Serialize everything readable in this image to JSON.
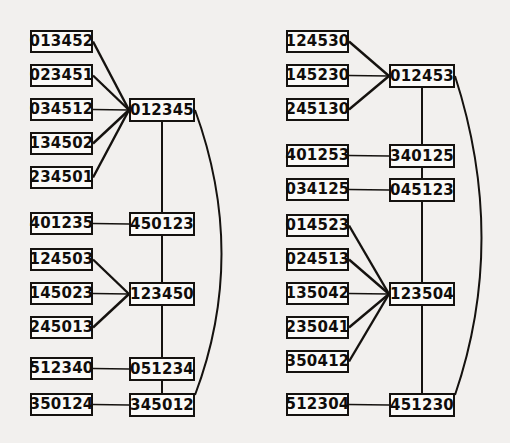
{
  "figure": {
    "background_color": "#f2f0ee",
    "node_fill": "#fbfaf8",
    "node_stroke": "#15120f",
    "edge_color": "#15120f"
  },
  "diagrams": [
    {
      "name": "left-diagram",
      "left_column": [
        {
          "id": "L0",
          "label": "013452",
          "x": 30,
          "y": 30,
          "w": 63,
          "h": 23
        },
        {
          "id": "L1",
          "label": "023451",
          "x": 30,
          "y": 64,
          "w": 63,
          "h": 23
        },
        {
          "id": "L2",
          "label": "034512",
          "x": 30,
          "y": 98,
          "w": 63,
          "h": 23
        },
        {
          "id": "L3",
          "label": "134502",
          "x": 30,
          "y": 132,
          "w": 63,
          "h": 23
        },
        {
          "id": "L4",
          "label": "234501",
          "x": 30,
          "y": 166,
          "w": 63,
          "h": 23
        },
        {
          "id": "L5",
          "label": "401235",
          "x": 30,
          "y": 212,
          "w": 63,
          "h": 23
        },
        {
          "id": "L6",
          "label": "124503",
          "x": 30,
          "y": 248,
          "w": 63,
          "h": 23
        },
        {
          "id": "L7",
          "label": "145023",
          "x": 30,
          "y": 282,
          "w": 63,
          "h": 23
        },
        {
          "id": "L8",
          "label": "245013",
          "x": 30,
          "y": 316,
          "w": 63,
          "h": 23
        },
        {
          "id": "L9",
          "label": "512340",
          "x": 30,
          "y": 357,
          "w": 63,
          "h": 23
        },
        {
          "id": "L10",
          "label": "350124",
          "x": 30,
          "y": 393,
          "w": 63,
          "h": 23
        }
      ],
      "right_column": [
        {
          "id": "R0",
          "label": "012345",
          "x": 129,
          "y": 98,
          "w": 66,
          "h": 24
        },
        {
          "id": "R1",
          "label": "450123",
          "x": 129,
          "y": 212,
          "w": 66,
          "h": 24
        },
        {
          "id": "R2",
          "label": "123450",
          "x": 129,
          "y": 282,
          "w": 66,
          "h": 24
        },
        {
          "id": "R3",
          "label": "051234",
          "x": 129,
          "y": 357,
          "w": 66,
          "h": 24
        },
        {
          "id": "R4",
          "label": "345012",
          "x": 129,
          "y": 393,
          "w": 66,
          "h": 24
        }
      ],
      "fan_edges": [
        {
          "from": "L0",
          "to": "R0"
        },
        {
          "from": "L1",
          "to": "R0"
        },
        {
          "from": "L2",
          "to": "R0"
        },
        {
          "from": "L3",
          "to": "R0"
        },
        {
          "from": "L4",
          "to": "R0"
        },
        {
          "from": "L5",
          "to": "R1"
        },
        {
          "from": "L6",
          "to": "R2"
        },
        {
          "from": "L7",
          "to": "R2"
        },
        {
          "from": "L8",
          "to": "R2"
        },
        {
          "from": "L9",
          "to": "R3"
        },
        {
          "from": "L10",
          "to": "R4"
        }
      ],
      "spine": {
        "x": 162,
        "y1": 122,
        "y2": 393
      },
      "arc": {
        "x1": 195,
        "y1": 110,
        "cx": 248,
        "cy": 255,
        "x2": 195,
        "y2": 395
      }
    },
    {
      "name": "right-diagram",
      "left_column": [
        {
          "id": "RL0",
          "label": "124530",
          "x": 286,
          "y": 30,
          "w": 63,
          "h": 23
        },
        {
          "id": "RL1",
          "label": "145230",
          "x": 286,
          "y": 64,
          "w": 63,
          "h": 23
        },
        {
          "id": "RL2",
          "label": "245130",
          "x": 286,
          "y": 98,
          "w": 63,
          "h": 23
        },
        {
          "id": "RL3",
          "label": "401253",
          "x": 286,
          "y": 144,
          "w": 63,
          "h": 23
        },
        {
          "id": "RL4",
          "label": "034125",
          "x": 286,
          "y": 178,
          "w": 63,
          "h": 23
        },
        {
          "id": "RL5",
          "label": "014523",
          "x": 286,
          "y": 214,
          "w": 63,
          "h": 23
        },
        {
          "id": "RL6",
          "label": "024513",
          "x": 286,
          "y": 248,
          "w": 63,
          "h": 23
        },
        {
          "id": "RL7",
          "label": "135042",
          "x": 286,
          "y": 282,
          "w": 63,
          "h": 23
        },
        {
          "id": "RL8",
          "label": "235041",
          "x": 286,
          "y": 316,
          "w": 63,
          "h": 23
        },
        {
          "id": "RL9",
          "label": "350412",
          "x": 286,
          "y": 350,
          "w": 63,
          "h": 23
        },
        {
          "id": "RL10",
          "label": "512304",
          "x": 286,
          "y": 393,
          "w": 63,
          "h": 23
        }
      ],
      "right_column": [
        {
          "id": "RR0",
          "label": "012453",
          "x": 389,
          "y": 64,
          "w": 66,
          "h": 24
        },
        {
          "id": "RR1",
          "label": "340125",
          "x": 389,
          "y": 144,
          "w": 66,
          "h": 24
        },
        {
          "id": "RR2",
          "label": "045123",
          "x": 389,
          "y": 178,
          "w": 66,
          "h": 24
        },
        {
          "id": "RR3",
          "label": "123504",
          "x": 389,
          "y": 282,
          "w": 66,
          "h": 24
        },
        {
          "id": "RR4",
          "label": "451230",
          "x": 389,
          "y": 393,
          "w": 66,
          "h": 24
        }
      ],
      "fan_edges": [
        {
          "from": "RL0",
          "to": "RR0"
        },
        {
          "from": "RL1",
          "to": "RR0"
        },
        {
          "from": "RL2",
          "to": "RR0"
        },
        {
          "from": "RL3",
          "to": "RR1"
        },
        {
          "from": "RL4",
          "to": "RR2"
        },
        {
          "from": "RL5",
          "to": "RR3"
        },
        {
          "from": "RL6",
          "to": "RR3"
        },
        {
          "from": "RL7",
          "to": "RR3"
        },
        {
          "from": "RL8",
          "to": "RR3"
        },
        {
          "from": "RL9",
          "to": "RR3"
        },
        {
          "from": "RL10",
          "to": "RR4"
        }
      ],
      "spine": {
        "x": 422,
        "y1": 88,
        "y2": 393
      },
      "arc": {
        "x1": 455,
        "y1": 76,
        "cx": 508,
        "cy": 240,
        "x2": 455,
        "y2": 395
      }
    }
  ]
}
